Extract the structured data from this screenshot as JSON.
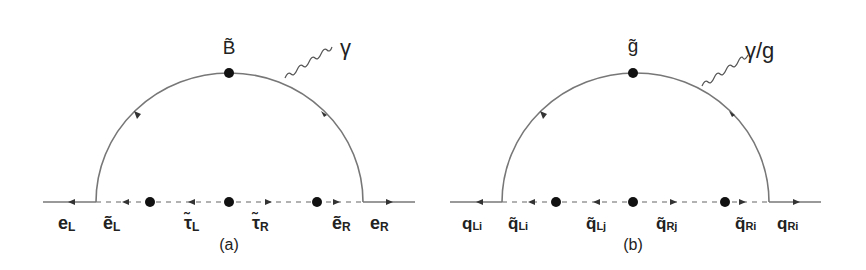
{
  "figure": {
    "panels": [
      {
        "id": "a",
        "caption": "(a)",
        "loop_particle": "B̃",
        "emitted_boson": "γ",
        "external_left": "e",
        "external_left_sub": "L",
        "external_right": "e",
        "external_right_sub": "R",
        "internal_labels": [
          {
            "base": "ẽ",
            "sub": "L"
          },
          {
            "base": "τ̃",
            "sub": "L"
          },
          {
            "base": "τ̃",
            "sub": "R"
          },
          {
            "base": "ẽ",
            "sub": "R"
          }
        ],
        "mass_insertions": 3
      },
      {
        "id": "b",
        "caption": "(b)",
        "loop_particle": "g̃",
        "emitted_boson": "γ/g",
        "external_left": "q",
        "external_left_sub": "Li",
        "external_right": "q",
        "external_right_sub": "Ri",
        "internal_labels": [
          {
            "base": "q̃",
            "sub": "Li"
          },
          {
            "base": "q̃",
            "sub": "Lj"
          },
          {
            "base": "q̃",
            "sub": "Rj"
          },
          {
            "base": "q̃",
            "sub": "Ri"
          }
        ],
        "mass_insertions": 3
      }
    ],
    "colors": {
      "line": "#777777",
      "dashed": "#999999",
      "dot": "#111111",
      "text": "#222222"
    }
  }
}
